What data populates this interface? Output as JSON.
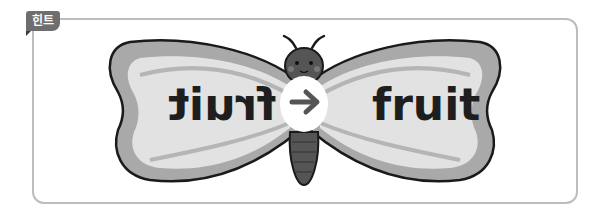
{
  "hint": {
    "tag_label": "힌트"
  },
  "illustration": {
    "subject": "butterfly",
    "left_wing_text": "fruit",
    "left_wing_text_mirrored": true,
    "right_wing_text": "fruit",
    "center_arrow": "→"
  },
  "colors": {
    "border": "#bdbdbd",
    "tag_bg": "#6e6e6e",
    "wing_outer": "#a9a9a9",
    "wing_inner": "#e0e0e0",
    "body": "#555555",
    "text": "#1e1e1e"
  }
}
